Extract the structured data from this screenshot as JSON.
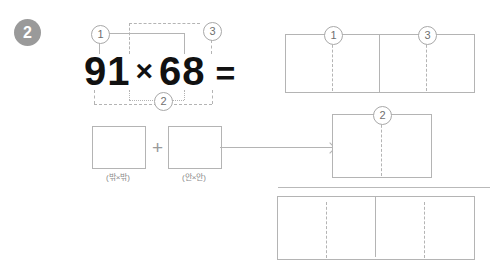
{
  "problem": {
    "number": "2"
  },
  "equation": {
    "left_factor": "91",
    "operator": "×",
    "right_factor": "68",
    "equals": "="
  },
  "connectors": {
    "badge_one": "1",
    "badge_two": "2",
    "badge_three": "3"
  },
  "work_boxes": [
    {
      "label": "(밖×밖)",
      "value": ""
    },
    {
      "label": "(안×안)",
      "value": ""
    }
  ],
  "operators": {
    "plus": "+"
  },
  "result_boxes": {
    "top_left": {
      "badge": "1",
      "value": ""
    },
    "top_right": {
      "badge": "3",
      "value": ""
    },
    "middle": {
      "badge": "2",
      "value": ""
    },
    "bottom": {
      "value": ""
    }
  },
  "colors": {
    "badge_fill": "#9a9a9a",
    "line": "#b4b4b4",
    "text": "#111111",
    "label_text": "#8a8a8a"
  }
}
